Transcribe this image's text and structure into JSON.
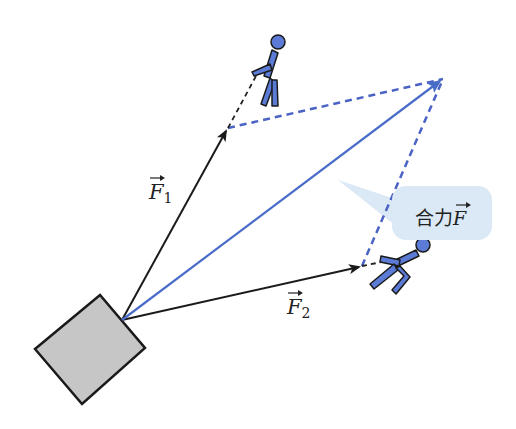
{
  "diagram": {
    "labels": {
      "f1": {
        "symbol": "F",
        "subscript": "1"
      },
      "f2": {
        "symbol": "F",
        "subscript": "2"
      },
      "resultant": {
        "prefix": "合力",
        "symbol": "F"
      }
    },
    "colors": {
      "force_arrow": "#1a1a1a",
      "resultant_arrow": "#4a6cc9",
      "dashed_line": "#4a63c4",
      "callout_bg": "#dbe8f6",
      "box_fill": "#c6c6c6",
      "figure_fill": "#5b7bd6"
    },
    "points": {
      "origin": [
        122,
        320
      ],
      "f1_tip": [
        228,
        128
      ],
      "f2_tip": [
        362,
        266
      ],
      "resultant_tip": [
        443,
        79
      ]
    }
  }
}
